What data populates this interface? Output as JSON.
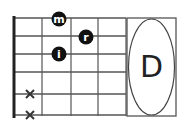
{
  "chord": {
    "name": "D",
    "colors": {
      "line": "#444444",
      "nut": "#222222",
      "dot": "#111111",
      "dot_text": "#ffffff",
      "mute": "#333333"
    },
    "strings_y": [
      18,
      36,
      54,
      72,
      94,
      115
    ],
    "frets_x": [
      42,
      71,
      98,
      126
    ],
    "nut_x": 14,
    "fingers": [
      {
        "label": "m",
        "string": 1,
        "fret": 1,
        "cx": 59,
        "cy": 19
      },
      {
        "label": "r",
        "string": 2,
        "fret": 2,
        "cx": 86,
        "cy": 37
      },
      {
        "label": "i",
        "string": 3,
        "fret": 1,
        "cx": 59,
        "cy": 54
      }
    ],
    "muted": [
      {
        "label": "x",
        "string": 5,
        "cx": 30,
        "cy": 94
      },
      {
        "label": "x",
        "string": 6,
        "cx": 30,
        "cy": 115
      }
    ]
  }
}
